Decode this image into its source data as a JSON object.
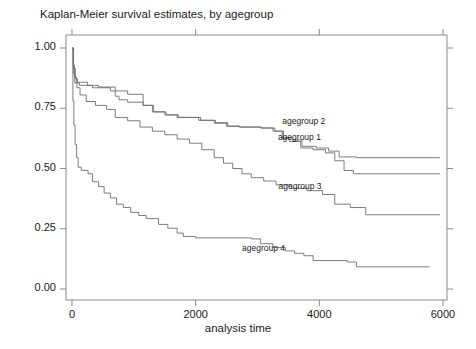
{
  "chart_data": {
    "type": "line",
    "title": "Kaplan-Meier survival estimates, by agegroup",
    "xlabel": "analysis time",
    "ylabel": "",
    "xlim": [
      0,
      6000
    ],
    "ylim": [
      0,
      1.0
    ],
    "xticks": [
      0,
      2000,
      4000,
      6000
    ],
    "xtick_labels": [
      "0",
      "2000",
      "4000",
      "6000"
    ],
    "yticks": [
      0.0,
      0.25,
      0.5,
      0.75,
      1.0
    ],
    "ytick_labels": [
      "0.00",
      "0.25",
      "0.50",
      "0.75",
      "1.00"
    ],
    "grid": false,
    "legend_position": "inline-annotations",
    "step_style": "post",
    "line_color": "#6e6e6e",
    "frame_color": "#8a8a8a",
    "annotations": [
      {
        "text": "agegroup 2",
        "x": 3400,
        "y": 0.695
      },
      {
        "text": "agegroup 1",
        "x": 3330,
        "y": 0.625
      },
      {
        "text": "agegroup 3",
        "x": 3340,
        "y": 0.425
      },
      {
        "text": "agegroup 4",
        "x": 2750,
        "y": 0.165
      }
    ],
    "series": [
      {
        "name": "agegroup 1",
        "label": "agegroup 1",
        "points": [
          [
            0,
            1.0
          ],
          [
            20,
            0.93
          ],
          [
            40,
            0.88
          ],
          [
            70,
            0.855
          ],
          [
            120,
            0.845
          ],
          [
            330,
            0.835
          ],
          [
            620,
            0.822
          ],
          [
            700,
            0.8
          ],
          [
            760,
            0.785
          ],
          [
            900,
            0.775
          ],
          [
            1150,
            0.762
          ],
          [
            1300,
            0.735
          ],
          [
            1500,
            0.723
          ],
          [
            1700,
            0.712
          ],
          [
            2050,
            0.7
          ],
          [
            2300,
            0.688
          ],
          [
            2500,
            0.675
          ],
          [
            2700,
            0.672
          ],
          [
            3050,
            0.668
          ],
          [
            3250,
            0.655
          ],
          [
            3400,
            0.625
          ],
          [
            3520,
            0.612
          ],
          [
            3700,
            0.585
          ],
          [
            3900,
            0.578
          ],
          [
            4100,
            0.565
          ],
          [
            4250,
            0.532
          ],
          [
            4400,
            0.492
          ],
          [
            4550,
            0.478
          ],
          [
            5950,
            0.478
          ]
        ]
      },
      {
        "name": "agegroup 2",
        "label": "agegroup 2",
        "points": [
          [
            0,
            1.0
          ],
          [
            25,
            0.915
          ],
          [
            55,
            0.872
          ],
          [
            90,
            0.858
          ],
          [
            250,
            0.845
          ],
          [
            430,
            0.838
          ],
          [
            700,
            0.822
          ],
          [
            900,
            0.808
          ],
          [
            1150,
            0.762
          ],
          [
            1320,
            0.735
          ],
          [
            1520,
            0.722
          ],
          [
            1720,
            0.712
          ],
          [
            2080,
            0.7
          ],
          [
            2320,
            0.69
          ],
          [
            2520,
            0.676
          ],
          [
            2720,
            0.672
          ],
          [
            3060,
            0.668
          ],
          [
            3280,
            0.655
          ],
          [
            3420,
            0.628
          ],
          [
            3560,
            0.618
          ],
          [
            3720,
            0.592
          ],
          [
            3950,
            0.585
          ],
          [
            4150,
            0.572
          ],
          [
            4320,
            0.548
          ],
          [
            4600,
            0.545
          ],
          [
            5950,
            0.545
          ]
        ]
      },
      {
        "name": "agegroup 3",
        "label": "agegroup 3",
        "points": [
          [
            0,
            1.0
          ],
          [
            20,
            0.895
          ],
          [
            45,
            0.855
          ],
          [
            80,
            0.835
          ],
          [
            130,
            0.805
          ],
          [
            230,
            0.778
          ],
          [
            380,
            0.762
          ],
          [
            560,
            0.745
          ],
          [
            700,
            0.712
          ],
          [
            900,
            0.698
          ],
          [
            1100,
            0.672
          ],
          [
            1300,
            0.655
          ],
          [
            1500,
            0.64
          ],
          [
            1700,
            0.622
          ],
          [
            1900,
            0.605
          ],
          [
            2100,
            0.578
          ],
          [
            2300,
            0.545
          ],
          [
            2450,
            0.522
          ],
          [
            2600,
            0.5
          ],
          [
            2750,
            0.478
          ],
          [
            2900,
            0.462
          ],
          [
            3100,
            0.448
          ],
          [
            3300,
            0.432
          ],
          [
            3550,
            0.418
          ],
          [
            3800,
            0.408
          ],
          [
            4050,
            0.392
          ],
          [
            4250,
            0.352
          ],
          [
            4500,
            0.338
          ],
          [
            4750,
            0.308
          ],
          [
            5950,
            0.308
          ]
        ]
      },
      {
        "name": "agegroup 4",
        "label": "agegroup 4",
        "points": [
          [
            0,
            1.0
          ],
          [
            15,
            0.78
          ],
          [
            30,
            0.68
          ],
          [
            50,
            0.6
          ],
          [
            75,
            0.545
          ],
          [
            100,
            0.505
          ],
          [
            150,
            0.492
          ],
          [
            260,
            0.478
          ],
          [
            330,
            0.445
          ],
          [
            430,
            0.425
          ],
          [
            520,
            0.398
          ],
          [
            620,
            0.378
          ],
          [
            720,
            0.352
          ],
          [
            830,
            0.338
          ],
          [
            950,
            0.318
          ],
          [
            1080,
            0.305
          ],
          [
            1200,
            0.292
          ],
          [
            1400,
            0.268
          ],
          [
            1550,
            0.252
          ],
          [
            1700,
            0.232
          ],
          [
            1800,
            0.218
          ],
          [
            2000,
            0.212
          ],
          [
            2900,
            0.208
          ],
          [
            3050,
            0.188
          ],
          [
            3250,
            0.172
          ],
          [
            3450,
            0.158
          ],
          [
            3600,
            0.148
          ],
          [
            3750,
            0.138
          ],
          [
            3900,
            0.118
          ],
          [
            4450,
            0.112
          ],
          [
            4600,
            0.092
          ],
          [
            5780,
            0.092
          ]
        ]
      }
    ]
  },
  "geometry": {
    "plot_left": 72,
    "plot_right": 443,
    "plot_top": 48,
    "plot_bottom": 289,
    "frame_left": 66,
    "frame_right": 447,
    "frame_top": 35,
    "frame_bottom": 300
  }
}
